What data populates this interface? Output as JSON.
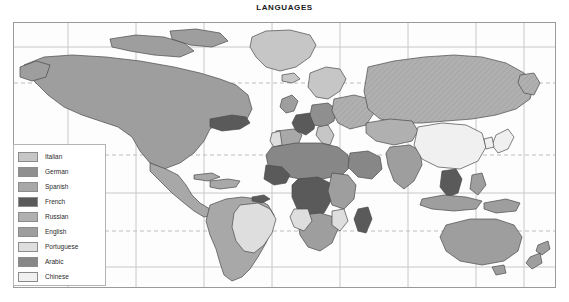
{
  "title": "LANGUAGES",
  "legend": {
    "items": [
      {
        "label": "Italian",
        "color": "#c6c6c6"
      },
      {
        "label": "German",
        "color": "#8f8f8f"
      },
      {
        "label": "Spanish",
        "color": "#a8a8a8"
      },
      {
        "label": "French",
        "color": "#5a5a5a"
      },
      {
        "label": "Russian",
        "color": "#b0b0b0"
      },
      {
        "label": "English",
        "color": "#9e9e9e"
      },
      {
        "label": "Portuguese",
        "color": "#dedede"
      },
      {
        "label": "Arabic",
        "color": "#878787"
      },
      {
        "label": "Chinese",
        "color": "#f0f0f0"
      }
    ]
  },
  "map": {
    "frame_color": "#9a9a9a",
    "graticule_color": "#c3c3c3",
    "tropic_line_color": "#b9b9b9",
    "coast_color": "#4a4a4a",
    "ocean_color": "#fdfdfd",
    "regions": [
      {
        "name": "canada-usa",
        "language": "English"
      },
      {
        "name": "quebec",
        "language": "French"
      },
      {
        "name": "greenland",
        "language": "Italian"
      },
      {
        "name": "mexico-central-america",
        "language": "Spanish"
      },
      {
        "name": "caribbean",
        "language": "Spanish"
      },
      {
        "name": "brazil",
        "language": "Portuguese"
      },
      {
        "name": "south-america-andes-cone",
        "language": "Spanish"
      },
      {
        "name": "guyanas",
        "language": "French"
      },
      {
        "name": "iberia-spain",
        "language": "Spanish"
      },
      {
        "name": "portugal",
        "language": "Portuguese"
      },
      {
        "name": "france",
        "language": "French"
      },
      {
        "name": "germany-central-europe",
        "language": "German"
      },
      {
        "name": "italy",
        "language": "Italian"
      },
      {
        "name": "british-isles",
        "language": "English"
      },
      {
        "name": "scandinavia",
        "language": "Italian"
      },
      {
        "name": "eastern-europe",
        "language": "Russian"
      },
      {
        "name": "russia-siberia",
        "language": "Russian"
      },
      {
        "name": "central-asia",
        "language": "Russian"
      },
      {
        "name": "north-africa",
        "language": "Arabic"
      },
      {
        "name": "arabian-peninsula",
        "language": "Arabic"
      },
      {
        "name": "sahel-west-africa",
        "language": "French"
      },
      {
        "name": "central-africa-congo",
        "language": "French"
      },
      {
        "name": "east-africa",
        "language": "English"
      },
      {
        "name": "southern-africa",
        "language": "English"
      },
      {
        "name": "angola-mozambique",
        "language": "Portuguese"
      },
      {
        "name": "madagascar",
        "language": "French"
      },
      {
        "name": "india-south-asia",
        "language": "English"
      },
      {
        "name": "china",
        "language": "Chinese"
      },
      {
        "name": "indochina",
        "language": "French"
      },
      {
        "name": "japan",
        "language": "Chinese"
      },
      {
        "name": "indonesia-philippines",
        "language": "English"
      },
      {
        "name": "australia",
        "language": "English"
      },
      {
        "name": "new-zealand",
        "language": "English"
      }
    ]
  }
}
